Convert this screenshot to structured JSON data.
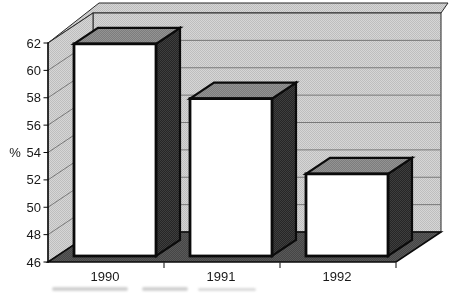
{
  "chart_data": {
    "type": "bar",
    "projection": "3d",
    "title": "",
    "xlabel": "",
    "ylabel": "%",
    "categories": [
      "1990",
      "1991",
      "1992"
    ],
    "values": [
      61.5,
      57.5,
      52
    ],
    "ylim": [
      46,
      62
    ],
    "ytick_step": 2,
    "ytick_labels": [
      "46",
      "48",
      "50",
      "52",
      "54",
      "56",
      "58",
      "60",
      "62"
    ],
    "grid": true,
    "legend": false,
    "wall_style": "gray-halftone",
    "bar_front_color": "#ffffff"
  },
  "colors": {
    "page_bg": "#ffffff",
    "wall_base": "#d4d4d4",
    "wall_dot": "#bdbdbd",
    "floor_base": "#474747",
    "floor_dot": "#5a5a5a",
    "bar_side_base": "#282828",
    "bar_side_dot": "#3f3f3f",
    "bar_top_base": "#7d7d7d",
    "bar_top_dot": "#939393",
    "bar_front": "#ffffff",
    "outline": "#0d0d0d",
    "wall_edge": "#2a2a2a",
    "gridline": "#6f6f6f",
    "text": "#1b1b1b"
  }
}
